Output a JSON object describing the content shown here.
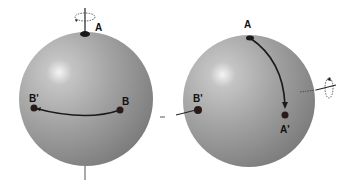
{
  "left_sphere": {
    "labels": {
      "a": "A",
      "b": "B",
      "b_prime": "B'"
    },
    "rotation_axis": "vertical"
  },
  "right_sphere": {
    "labels": {
      "a": "A",
      "a_prime": "A'",
      "b_prime": "B'"
    },
    "rotation_axis": "horizontal"
  }
}
